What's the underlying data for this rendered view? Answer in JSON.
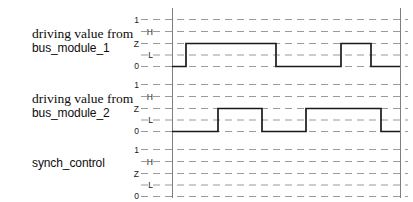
{
  "figure": {
    "kind": "digital-timing-diagram",
    "width": 413,
    "height": 202,
    "background_color": "#ffffff",
    "grid_color": "#9a9a9a",
    "axis_color": "#7f7f7f",
    "trace_color": "#1a1a1a"
  },
  "axis": {
    "tick_labels": [
      "1",
      "H",
      "Z",
      "L",
      "0"
    ],
    "tick_label_indent": [
      false,
      true,
      false,
      true,
      false
    ],
    "level_names": {
      "one": "1",
      "high": "H",
      "tristate": "Z",
      "low": "L",
      "zero": "0"
    }
  },
  "rows": [
    {
      "label_line1": "driving value from",
      "label_line2": "bus_module_1",
      "signal_name": "bus_module_1",
      "has_waveform": true
    },
    {
      "label_line1": "driving value from",
      "label_line2": "bus_module_2",
      "signal_name": "bus_module_2",
      "has_waveform": true
    },
    {
      "label_line1": "synch_control",
      "label_line2": "",
      "signal_name": "synch_control",
      "has_waveform": false
    }
  ],
  "chart_data": {
    "type": "line",
    "title": "",
    "xlabel": "",
    "ylabel": "",
    "grid": true,
    "legend_position": "none",
    "x_axis_start_px": 172,
    "x_axis_end_px": 400,
    "y_levels": [
      "1",
      "H",
      "Z",
      "L",
      "0"
    ],
    "series": [
      {
        "name": "driving value from bus_module_1",
        "levels_used": [
          "0",
          "Z"
        ],
        "transitions_px": [
          172,
          186,
          276,
          341,
          371,
          400
        ],
        "level_sequence": [
          "0",
          "Z",
          "0",
          "Z",
          "0"
        ],
        "points": [
          {
            "x": 172,
            "level": "0"
          },
          {
            "x": 186,
            "level": "0"
          },
          {
            "x": 186,
            "level": "Z"
          },
          {
            "x": 276,
            "level": "Z"
          },
          {
            "x": 276,
            "level": "0"
          },
          {
            "x": 341,
            "level": "0"
          },
          {
            "x": 341,
            "level": "Z"
          },
          {
            "x": 371,
            "level": "Z"
          },
          {
            "x": 371,
            "level": "0"
          },
          {
            "x": 400,
            "level": "0"
          }
        ]
      },
      {
        "name": "driving value from bus_module_2",
        "levels_used": [
          "0",
          "Z"
        ],
        "transitions_px": [
          172,
          218,
          262,
          306,
          381,
          400
        ],
        "level_sequence": [
          "0",
          "Z",
          "0",
          "Z",
          "0"
        ],
        "points": [
          {
            "x": 172,
            "level": "0"
          },
          {
            "x": 218,
            "level": "0"
          },
          {
            "x": 218,
            "level": "Z"
          },
          {
            "x": 262,
            "level": "Z"
          },
          {
            "x": 262,
            "level": "0"
          },
          {
            "x": 306,
            "level": "0"
          },
          {
            "x": 306,
            "level": "Z"
          },
          {
            "x": 381,
            "level": "Z"
          },
          {
            "x": 381,
            "level": "0"
          },
          {
            "x": 400,
            "level": "0"
          }
        ]
      },
      {
        "name": "synch_control",
        "levels_used": [],
        "transitions_px": [],
        "level_sequence": [],
        "points": []
      }
    ]
  }
}
